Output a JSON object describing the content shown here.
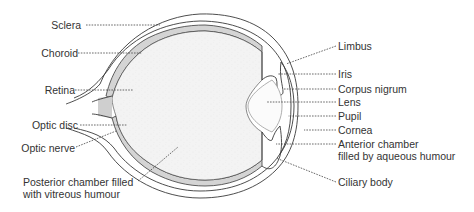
{
  "diagram": {
    "colors": {
      "outline": "#3a3a3a",
      "retina_fill": "#d4d4d4",
      "vitreous_fill": "#f2f2f2",
      "text": "#333333",
      "background": "#ffffff"
    },
    "labels_left": [
      {
        "id": "sclera",
        "text": "Sclera"
      },
      {
        "id": "choroid",
        "text": "Choroid"
      },
      {
        "id": "retina",
        "text": "Retina"
      },
      {
        "id": "optic_disc",
        "text": "Optic disc"
      },
      {
        "id": "optic_nerve",
        "text": "Optic nerve"
      },
      {
        "id": "posterior_chamber",
        "text": "Posterior chamber filled\nwith vitreous humour"
      }
    ],
    "labels_right": [
      {
        "id": "limbus",
        "text": "Limbus"
      },
      {
        "id": "iris",
        "text": "Iris"
      },
      {
        "id": "corpus_nigrum",
        "text": "Corpus nigrum"
      },
      {
        "id": "lens",
        "text": "Lens"
      },
      {
        "id": "pupil",
        "text": "Pupil"
      },
      {
        "id": "cornea",
        "text": "Cornea"
      },
      {
        "id": "anterior_chamber",
        "text": "Anterior chamber\nfilled by aqueous humour"
      },
      {
        "id": "ciliary_body",
        "text": "Ciliary body"
      }
    ]
  }
}
